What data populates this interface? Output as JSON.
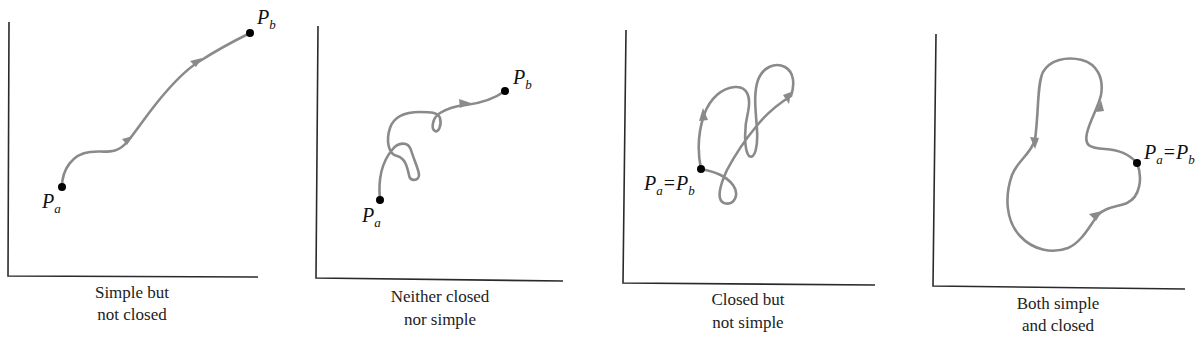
{
  "colors": {
    "curve": "#8a8a8a",
    "axis": "#2a2a2a",
    "point": "#000000",
    "text": "#222222"
  },
  "panels": [
    {
      "id": "simple-not-closed",
      "caption_line1": "Simple but",
      "caption_line2": "not closed",
      "start_label": {
        "main": "P",
        "sub": "a"
      },
      "end_label": {
        "main": "P",
        "sub": "b"
      }
    },
    {
      "id": "neither-closed-nor-simple",
      "caption_line1": "Neither closed",
      "caption_line2": "nor simple",
      "start_label": {
        "main": "P",
        "sub": "a"
      },
      "end_label": {
        "main": "P",
        "sub": "b"
      }
    },
    {
      "id": "closed-not-simple",
      "caption_line1": "Closed but",
      "caption_line2": "not simple",
      "point_label": {
        "left_main": "P",
        "left_sub": "a",
        "equals": "=",
        "right_main": "P",
        "right_sub": "b"
      }
    },
    {
      "id": "simple-and-closed",
      "caption_line1": "Both simple",
      "caption_line2": "and closed",
      "point_label": {
        "left_main": "P",
        "left_sub": "a",
        "equals": "=",
        "right_main": "P",
        "right_sub": "b"
      }
    }
  ]
}
